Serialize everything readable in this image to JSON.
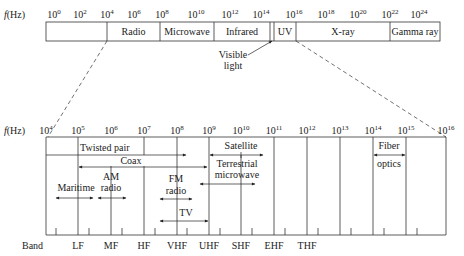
{
  "top_spectrum": {
    "axis_label": "f(Hz)",
    "ticks": [
      {
        "base": "10",
        "exp": "0",
        "x": 54
      },
      {
        "base": "10",
        "exp": "2",
        "x": 80
      },
      {
        "base": "10",
        "exp": "4",
        "x": 107
      },
      {
        "base": "10",
        "exp": "6",
        "x": 134
      },
      {
        "base": "10",
        "exp": "8",
        "x": 162
      },
      {
        "base": "10",
        "exp": "10",
        "x": 196
      },
      {
        "base": "10",
        "exp": "12",
        "x": 230
      },
      {
        "base": "10",
        "exp": "14",
        "x": 261
      },
      {
        "base": "10",
        "exp": "16",
        "x": 294
      },
      {
        "base": "10",
        "exp": "18",
        "x": 326
      },
      {
        "base": "10",
        "exp": "20",
        "x": 358
      },
      {
        "base": "10",
        "exp": "22",
        "x": 390
      },
      {
        "base": "10",
        "exp": "24",
        "x": 419
      }
    ],
    "bands": [
      {
        "label": "Radio",
        "x1": 107,
        "x2": 160
      },
      {
        "label": "Microwave",
        "x1": 160,
        "x2": 214
      },
      {
        "label": "Infrared",
        "x1": 214,
        "x2": 270
      },
      {
        "label": "",
        "x1": 270,
        "x2": 274
      },
      {
        "label": "UV",
        "x1": 274,
        "x2": 296
      },
      {
        "label": "X-ray",
        "x1": 296,
        "x2": 390
      },
      {
        "label": "Gamma ray",
        "x1": 390,
        "x2": 440
      }
    ],
    "visible_label_line1": "Visible",
    "visible_label_line2": "light"
  },
  "bottom_spectrum": {
    "axis_label": "f(Hz)",
    "ticks": [
      {
        "base": "10",
        "exp": "4",
        "x": 46
      },
      {
        "base": "10",
        "exp": "5",
        "x": 78
      },
      {
        "base": "10",
        "exp": "6",
        "x": 111
      },
      {
        "base": "10",
        "exp": "7",
        "x": 144
      },
      {
        "base": "10",
        "exp": "8",
        "x": 177
      },
      {
        "base": "10",
        "exp": "9",
        "x": 209
      },
      {
        "base": "10",
        "exp": "10",
        "x": 241
      },
      {
        "base": "10",
        "exp": "11",
        "x": 274
      },
      {
        "base": "10",
        "exp": "12",
        "x": 307
      },
      {
        "base": "10",
        "exp": "13",
        "x": 340
      },
      {
        "base": "10",
        "exp": "14",
        "x": 373
      },
      {
        "base": "10",
        "exp": "15",
        "x": 406
      },
      {
        "base": "10",
        "exp": "16",
        "x": 446
      }
    ],
    "media": {
      "twisted_pair": "Twisted pair",
      "coax": "Coax",
      "satellite": "Satellite",
      "terrestrial_1": "Terrestrial",
      "terrestrial_2": "microwave",
      "fiber_1": "Fiber",
      "fiber_2": "optics",
      "maritime": "Maritime",
      "am_1": "AM",
      "am_2": "radio",
      "fm_1": "FM",
      "fm_2": "radio",
      "tv": "TV"
    },
    "band_row_label": "Band",
    "band_names": [
      {
        "label": "LF",
        "x": 78
      },
      {
        "label": "MF",
        "x": 111
      },
      {
        "label": "HF",
        "x": 144
      },
      {
        "label": "VHF",
        "x": 177
      },
      {
        "label": "UHF",
        "x": 209
      },
      {
        "label": "SHF",
        "x": 241
      },
      {
        "label": "EHF",
        "x": 274
      },
      {
        "label": "THF",
        "x": 307
      }
    ]
  }
}
